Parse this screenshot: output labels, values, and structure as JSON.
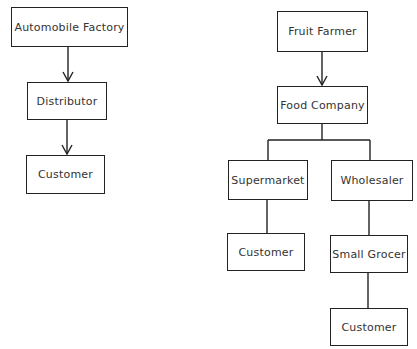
{
  "diagram": {
    "type": "distribution-chain-flowchart",
    "line_color": "#222222",
    "chains": [
      {
        "name": "automobile-chain",
        "nodes": [
          {
            "id": "automobile-factory",
            "label": "Automobile Factory"
          },
          {
            "id": "distributor",
            "label": "Distributor"
          },
          {
            "id": "customer-auto",
            "label": "Customer"
          }
        ],
        "edges": [
          {
            "from": "automobile-factory",
            "to": "distributor",
            "arrow": true
          },
          {
            "from": "distributor",
            "to": "customer-auto",
            "arrow": true
          }
        ]
      },
      {
        "name": "fruit-chain",
        "nodes": [
          {
            "id": "fruit-farmer",
            "label": "Fruit Farmer"
          },
          {
            "id": "food-company",
            "label": "Food Company"
          },
          {
            "id": "supermarket",
            "label": "Supermarket"
          },
          {
            "id": "wholesaler",
            "label": "Wholesaler"
          },
          {
            "id": "customer-supermarket",
            "label": "Customer"
          },
          {
            "id": "small-grocer",
            "label": "Small Grocer"
          },
          {
            "id": "customer-grocer",
            "label": "Customer"
          }
        ],
        "edges": [
          {
            "from": "fruit-farmer",
            "to": "food-company",
            "arrow": true
          },
          {
            "from": "food-company",
            "to": "supermarket",
            "arrow": false
          },
          {
            "from": "food-company",
            "to": "wholesaler",
            "arrow": false
          },
          {
            "from": "supermarket",
            "to": "customer-supermarket",
            "arrow": false
          },
          {
            "from": "wholesaler",
            "to": "small-grocer",
            "arrow": false
          },
          {
            "from": "small-grocer",
            "to": "customer-grocer",
            "arrow": false
          }
        ]
      }
    ]
  },
  "labels": {
    "automobile_factory": "Automobile Factory",
    "distributor": "Distributor",
    "customer_auto": "Customer",
    "fruit_farmer": "Fruit Farmer",
    "food_company": "Food Company",
    "supermarket": "Supermarket",
    "wholesaler": "Wholesaler",
    "customer_supermarket": "Customer",
    "small_grocer": "Small Grocer",
    "customer_grocer": "Customer"
  }
}
